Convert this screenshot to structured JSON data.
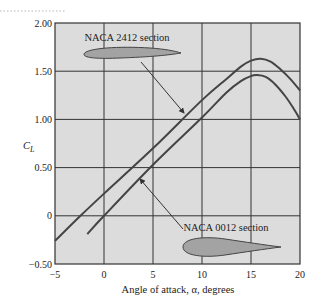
{
  "chart_data": {
    "type": "line",
    "title": "",
    "xlabel": "Angle of attack, α, degrees",
    "ylabel_main": "C",
    "ylabel_sub": "L",
    "xlim": [
      -5,
      20
    ],
    "ylim": [
      -0.5,
      2.0
    ],
    "xticks": [
      -5,
      0,
      5,
      10,
      15,
      20
    ],
    "xtick_labels": [
      "−5",
      "0",
      "5",
      "10",
      "15",
      "20"
    ],
    "yticks": [
      -0.5,
      0,
      0.5,
      1.0,
      1.5,
      2.0
    ],
    "ytick_labels": [
      "−0.50",
      "0",
      "0.50",
      "1.00",
      "1.50",
      "2.00"
    ],
    "grid": true,
    "plot_background": "#dcdcdc",
    "line_color": "#444444",
    "series": [
      {
        "name": "NACA 2412 section",
        "x": [
          -5,
          -2.4,
          0,
          5,
          10,
          12.5,
          14,
          15,
          16,
          17,
          18,
          19,
          20
        ],
        "y": [
          -0.26,
          0,
          0.23,
          0.7,
          1.2,
          1.42,
          1.55,
          1.61,
          1.63,
          1.6,
          1.52,
          1.42,
          1.3
        ]
      },
      {
        "name": "NACA 0012 section",
        "x": [
          -1.7,
          0,
          5,
          10,
          12.5,
          14,
          15,
          15.6,
          16.5,
          17.5,
          18.5,
          19.3,
          20
        ],
        "y": [
          -0.19,
          0,
          0.53,
          1.02,
          1.28,
          1.4,
          1.45,
          1.46,
          1.44,
          1.36,
          1.24,
          1.12,
          1.0
        ]
      }
    ],
    "annotations": [
      {
        "text": "NACA 2412 section",
        "label_x": 127,
        "label_y": 41,
        "arrow_from": [
          141,
          62
        ],
        "arrow_to": [
          184,
          113
        ],
        "airfoil": "cambered"
      },
      {
        "text": "NACA 0012 section",
        "label_x": 226,
        "label_y": 231,
        "arrow_from": [
          183,
          229
        ],
        "arrow_to": [
          140,
          179
        ],
        "airfoil": "symmetric"
      }
    ]
  }
}
